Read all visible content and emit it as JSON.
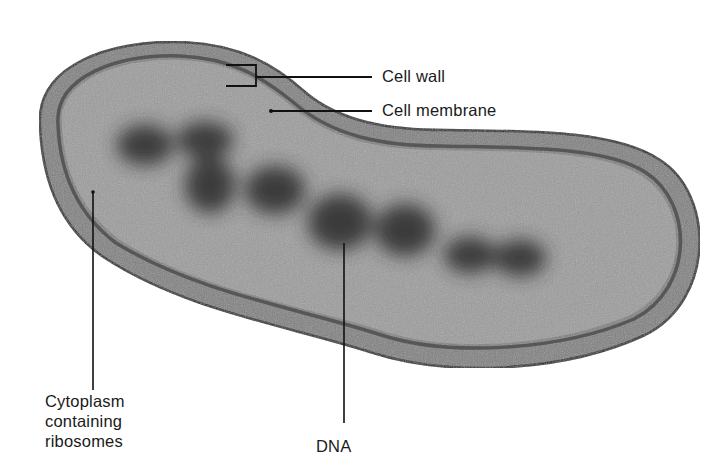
{
  "figure": {
    "type": "bacterial cell cross-section illustration",
    "cropped_top_text": "",
    "colors": {
      "outline": "#1c1c1c",
      "cell_wall": "#7d7d7d",
      "membrane": "#4a4a4a",
      "cytoplasm": "#9a9a9a",
      "dna": "#2e2e2e",
      "leader_line": "#111111",
      "label_text": "#1a1a1a"
    }
  },
  "labels": {
    "cell_wall": "Cell wall",
    "cell_membrane": "Cell membrane",
    "cytoplasm": "Cytoplasm\ncontaining\nribosomes",
    "dna": "DNA"
  }
}
